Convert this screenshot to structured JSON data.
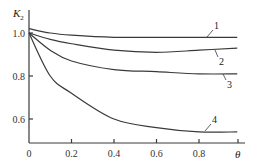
{
  "chart_data": {
    "type": "line",
    "title": "",
    "xlabel": "θ",
    "ylabel": "K₂",
    "xlim": [
      0,
      1.0
    ],
    "ylim": [
      0.5,
      1.05
    ],
    "x_ticks": [
      "0",
      "0.2",
      "0.4",
      "0.6",
      "0.8"
    ],
    "y_ticks": [
      "0.6",
      "0.8",
      "1.0"
    ],
    "grid": false,
    "legend": "inline curve labels",
    "series": [
      {
        "name": "1",
        "x": [
          0,
          0.1,
          0.2,
          0.4,
          0.6,
          0.8,
          0.98
        ],
        "values": [
          1.02,
          1.0,
          0.99,
          0.98,
          0.98,
          0.98,
          0.98
        ]
      },
      {
        "name": "2",
        "x": [
          0,
          0.1,
          0.2,
          0.4,
          0.6,
          0.8,
          0.98
        ],
        "values": [
          1.0,
          0.97,
          0.95,
          0.92,
          0.91,
          0.92,
          0.93
        ]
      },
      {
        "name": "3",
        "x": [
          0,
          0.1,
          0.2,
          0.4,
          0.6,
          0.8,
          0.98
        ],
        "values": [
          1.0,
          0.92,
          0.87,
          0.83,
          0.82,
          0.81,
          0.81
        ]
      },
      {
        "name": "4",
        "x": [
          0,
          0.1,
          0.2,
          0.4,
          0.6,
          0.8,
          0.98
        ],
        "values": [
          1.0,
          0.8,
          0.72,
          0.6,
          0.56,
          0.54,
          0.54
        ]
      }
    ]
  },
  "axes": {
    "y_title_main": "K",
    "y_title_sub": "2",
    "x_title": "θ",
    "x_ticks": [
      {
        "label": "0",
        "v": 0
      },
      {
        "label": "0.2",
        "v": 0.2
      },
      {
        "label": "0.4",
        "v": 0.4
      },
      {
        "label": "0.6",
        "v": 0.6
      },
      {
        "label": "0.8",
        "v": 0.8
      }
    ],
    "y_ticks": [
      {
        "label": "1.0",
        "v": 1.0
      },
      {
        "label": "0.8",
        "v": 0.8
      },
      {
        "label": "0.6",
        "v": 0.6
      }
    ]
  },
  "curve_labels": [
    "1",
    "2",
    "3",
    "4"
  ]
}
